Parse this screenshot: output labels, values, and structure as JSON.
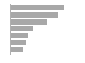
{
  "chart": {
    "title": "",
    "subtitle": "",
    "xlabel": "",
    "ylabel": "",
    "background_color": "#ffffff",
    "bar_color": "#a8a8a8",
    "axis_color": "#b0b0b0"
  },
  "chart_data": {
    "type": "bar",
    "orientation": "horizontal",
    "title": "",
    "xlabel": "",
    "ylabel": "",
    "categories": [
      "1",
      "2",
      "3",
      "4",
      "5",
      "6",
      "7"
    ],
    "values": [
      53,
      47,
      36,
      22,
      17,
      15,
      12
    ],
    "xlim": [
      0,
      74
    ],
    "ylim": [
      0,
      7
    ],
    "grid": false,
    "legend": false,
    "legend_position": "none",
    "tick_labels_x": [],
    "tick_labels_y": [],
    "annotations": [],
    "series": [
      {
        "name": "",
        "color": "#a8a8a8",
        "values": [
          53,
          47,
          36,
          22,
          17,
          15,
          12
        ]
      }
    ]
  }
}
